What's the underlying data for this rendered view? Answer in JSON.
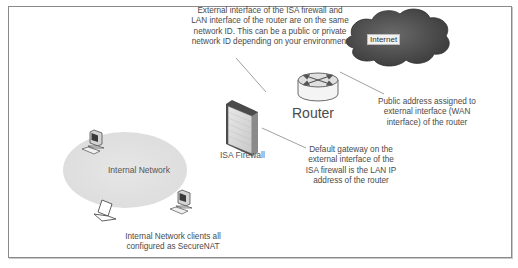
{
  "diagram": {
    "nodes": {
      "internet": {
        "label": "Internet",
        "icon": "cloud-icon"
      },
      "router": {
        "label": "Router",
        "icon": "router-icon"
      },
      "firewall": {
        "label": "ISA Firewall",
        "icon": "firewall-icon"
      },
      "internal_network": {
        "label": "Internal Network",
        "icon": "network-ellipse"
      },
      "clients": [
        {
          "icon": "desktop-computer-icon"
        },
        {
          "icon": "laptop-icon"
        },
        {
          "icon": "desktop-computer-icon"
        }
      ]
    },
    "annotations": {
      "shared_network": {
        "lines": [
          "External interface of the ISA firewall and",
          "LAN interface of the router are on the same",
          "network ID. This can be a public or private",
          "network ID depending on your environment"
        ]
      },
      "wan_address": {
        "lines": [
          "Public address assigned to",
          "external interface (WAN",
          "interface) of the router"
        ]
      },
      "default_gateway": {
        "lines": [
          "Default gateway on the",
          "external interface of the",
          "ISA firewall is the LAN IP",
          "address of the router"
        ]
      },
      "clients": {
        "lines": [
          "Internal Network clients all",
          "configured as SecureNAT"
        ]
      }
    },
    "colors": {
      "frame_border": "#8a8a8a",
      "cloud_fill": "#555555",
      "ellipse_fill": "#e2e2e2",
      "firewall_fill": "#d8d8d8",
      "leader_line": "#777777"
    }
  }
}
